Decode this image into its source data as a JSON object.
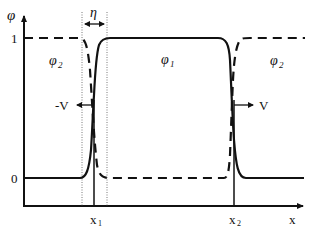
{
  "diagram": {
    "axes": {
      "y_label": "φ",
      "x_label": "x",
      "y_ticks": [
        {
          "label": "1",
          "level": 1
        },
        {
          "label": "0",
          "level": 0
        }
      ],
      "x_ticks": [
        {
          "label": "x",
          "sub": "1"
        },
        {
          "label": "x",
          "sub": "2"
        }
      ]
    },
    "interface_width_label": "η",
    "phases": {
      "phi1": {
        "label": "φ",
        "sub": "1"
      },
      "phi2_left": {
        "label": "φ",
        "sub": "2"
      },
      "phi2_right": {
        "label": "φ",
        "sub": "2"
      }
    },
    "velocities": {
      "left": "-V",
      "right": "V"
    },
    "curves": [
      {
        "name": "phi1",
        "style": "solid",
        "description": "0 outside [x1,x2], 1 inside, with peaks at interfaces"
      },
      {
        "name": "phi2",
        "style": "dashed",
        "description": "1 outside [x1,x2], 0 inside"
      }
    ],
    "colors": {
      "line": "#111111",
      "background": "#ffffff"
    }
  }
}
